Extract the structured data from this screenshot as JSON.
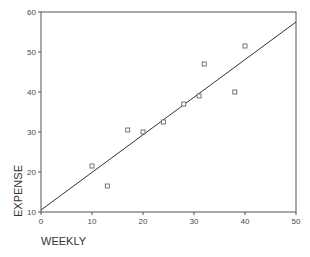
{
  "chart_data": {
    "type": "scatter",
    "title": "",
    "xlabel": "WEEKLY",
    "ylabel": "EXPENSE",
    "xlim": [
      0,
      50
    ],
    "ylim": [
      10,
      60
    ],
    "xticks": [
      0,
      10,
      20,
      30,
      40,
      50
    ],
    "yticks": [
      10,
      20,
      30,
      40,
      50,
      60
    ],
    "grid": false,
    "legend": null,
    "marker": "open-square",
    "series": [
      {
        "name": "observations",
        "points": [
          {
            "x": 10,
            "y": 21.5
          },
          {
            "x": 13,
            "y": 16.5
          },
          {
            "x": 17,
            "y": 30.5
          },
          {
            "x": 20,
            "y": 30
          },
          {
            "x": 24,
            "y": 32.5
          },
          {
            "x": 28,
            "y": 37
          },
          {
            "x": 31,
            "y": 39
          },
          {
            "x": 32,
            "y": 47
          },
          {
            "x": 38,
            "y": 40
          },
          {
            "x": 40,
            "y": 51.5
          }
        ]
      }
    ],
    "fit_line": {
      "name": "linear-fit",
      "x0": 0,
      "y0": 10.5,
      "x1": 50,
      "y1": 57.5
    }
  },
  "colors": {
    "axis": "#555555",
    "line": "#333333",
    "marker": "#555555",
    "background": "#ffffff"
  }
}
